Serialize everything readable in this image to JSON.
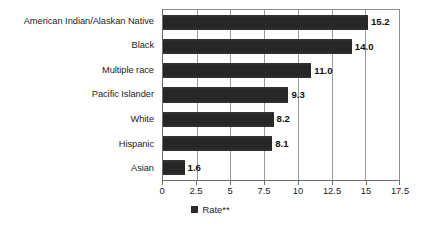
{
  "chart_data": {
    "type": "bar",
    "orientation": "horizontal",
    "title": "",
    "subtitle": "",
    "xlabel": "",
    "ylabel": "",
    "categories": [
      "American Indian/Alaskan Native",
      "Black",
      "Multiple race",
      "Pacific Islander",
      "White",
      "Hispanic",
      "Asian"
    ],
    "values": [
      15.2,
      14.0,
      11.0,
      9.3,
      8.2,
      8.1,
      1.6
    ],
    "value_labels": [
      "15.2",
      "14.0",
      "11.0",
      "9.3",
      "8.2",
      "8.1",
      "1.6"
    ],
    "series": [
      {
        "name": "Rate**",
        "values": [
          15.2,
          14.0,
          11.0,
          9.3,
          8.2,
          8.1,
          1.6
        ],
        "color": "#262626"
      }
    ],
    "xlim": [
      0,
      17.5
    ],
    "xticks": [
      0,
      2.5,
      5,
      7.5,
      10,
      12.5,
      15,
      17.5
    ],
    "xtick_labels": [
      "0",
      "2.5",
      "5",
      "7.5",
      "10",
      "12.5",
      "15",
      "17.5"
    ],
    "grid": "vertical",
    "legend": {
      "position": "bottom-center",
      "entries": [
        {
          "label": "Rate**",
          "color": "#262626",
          "marker": "filled-square"
        }
      ]
    },
    "colors": {
      "bar": "#262626",
      "axis": "#6e6e6e",
      "gridline": "#9a9a9a",
      "text": "#1c1c1c",
      "background": "#ffffff"
    }
  }
}
